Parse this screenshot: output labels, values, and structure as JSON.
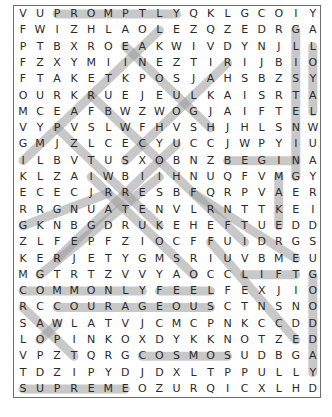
{
  "puzzle": {
    "rows": [
      "VUPROMPTLYQKLGCOIY",
      "FWIZHLAOLEZQZEDRGA",
      "PTBXROEAKWIVDYNJLL",
      "FZXYMIINEZTIRIJBIO",
      "FTAKETKPOSJAHSBZSY",
      "OURKRUEJEULKAISRTA",
      "MCEAFBWZWOGJAIFTEL",
      "VYPVSLWFHVSHJHLSNW",
      "GMJZLCECYUCCJWPYIU",
      "ILBVTUSXOBNZBEGINA",
      "KLZAIWBIIHNUQFVMGY",
      "ECECJRRESBFQRPVAER",
      "RRGNUATENVLRNTTKEI",
      "GKNBGDRUKEHEFTUEDD",
      "ZLFEPFZIOCFFUIDRGS",
      "KERJETYGMSRIUVBMEU",
      "MGTRTZVVYAOCCLIFTG",
      "COMMONLYFEELFEXJIO",
      "RCCOURAGEOUSCTNSNO",
      "SAWLATVJCMCPNKCCDD",
      "LOPINKOXDYKKNOTZED",
      "VPZTQRGCOSMOSUDBGA",
      "TDZIPYDJDXLTPPULLY",
      "SUPREMEOZURQICXLHD"
    ],
    "found_words": [
      {
        "word": "PROMPTLY",
        "from": [
          0,
          2
        ],
        "to": [
          0,
          9
        ]
      },
      {
        "word": "GLISTENING",
        "from": [
          1,
          16
        ],
        "to": [
          10,
          16
        ]
      },
      {
        "word": "LOYAL",
        "from": [
          2,
          17
        ],
        "to": [
          6,
          17
        ]
      },
      {
        "word": "BEGIN",
        "from": [
          9,
          12
        ],
        "to": [
          9,
          16
        ]
      },
      {
        "word": "MAKE",
        "from": [
          10,
          15
        ],
        "to": [
          13,
          15
        ]
      },
      {
        "word": "LIFT",
        "from": [
          16,
          13
        ],
        "to": [
          16,
          16
        ]
      },
      {
        "word": "GOODDAY",
        "from": [
          16,
          17
        ],
        "to": [
          22,
          17
        ]
      },
      {
        "word": "COMMONLY",
        "from": [
          17,
          0
        ],
        "to": [
          17,
          7
        ]
      },
      {
        "word": "FEEL",
        "from": [
          17,
          8
        ],
        "to": [
          17,
          11
        ]
      },
      {
        "word": "COURAGEOUS",
        "from": [
          18,
          2
        ],
        "to": [
          18,
          11
        ]
      },
      {
        "word": "COSMOS",
        "from": [
          21,
          7
        ],
        "to": [
          21,
          12
        ]
      },
      {
        "word": "SUPREME",
        "from": [
          23,
          0
        ],
        "to": [
          23,
          6
        ]
      },
      {
        "word": "IMPARTIAL",
        "from": [
          9,
          0
        ],
        "to": [
          1,
          8
        ]
      },
      {
        "word": "ENOUGH",
        "from": [
          2,
          6
        ],
        "to": [
          7,
          11
        ]
      },
      {
        "word": "diag-3",
        "from": [
          3,
          12
        ],
        "to": [
          9,
          6
        ]
      },
      {
        "word": "diag-4",
        "from": [
          5,
          4
        ],
        "to": [
          14,
          13
        ]
      },
      {
        "word": "diag-5",
        "from": [
          7,
          2
        ],
        "to": [
          13,
          8
        ]
      },
      {
        "word": "diag-6",
        "from": [
          8,
          9
        ],
        "to": [
          15,
          2
        ]
      },
      {
        "word": "diag-7",
        "from": [
          10,
          8
        ],
        "to": [
          16,
          1
        ]
      },
      {
        "word": "diag-8",
        "from": [
          11,
          5
        ],
        "to": [
          13,
          0
        ]
      },
      {
        "word": "diag-9",
        "from": [
          10,
          4
        ],
        "to": [
          16,
          10
        ]
      },
      {
        "word": "diag-10",
        "from": [
          11,
          10
        ],
        "to": [
          15,
          16
        ]
      },
      {
        "word": "diag-11",
        "from": [
          14,
          11
        ],
        "to": [
          20,
          16
        ]
      },
      {
        "word": "diag-12",
        "from": [
          18,
          0
        ],
        "to": [
          21,
          3
        ]
      },
      {
        "word": "diag-13",
        "from": [
          19,
          2
        ],
        "to": [
          20,
          1
        ]
      }
    ]
  }
}
